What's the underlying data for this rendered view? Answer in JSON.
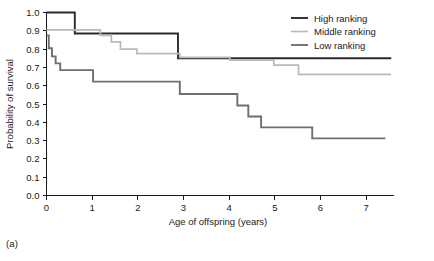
{
  "panel": {
    "label": "(a)"
  },
  "chart_data": {
    "type": "line",
    "title": "",
    "xlabel": "Age of offspring (years)",
    "ylabel": "Probability of survival",
    "xlim": [
      0,
      7.6
    ],
    "ylim": [
      0,
      1.0
    ],
    "xticks": [
      0,
      1,
      2,
      3,
      4,
      5,
      6,
      7
    ],
    "xticklabels": [
      "0",
      "1",
      "2",
      "3",
      "4",
      "5",
      "6",
      "7"
    ],
    "yticks": [
      0.0,
      0.1,
      0.2,
      0.3,
      0.4,
      0.5,
      0.6,
      0.7,
      0.8,
      0.9,
      1.0
    ],
    "yticklabels": [
      "0.0",
      "0.1",
      "0.2",
      "0.3",
      "0.4",
      "0.5",
      "0.6",
      "0.7",
      "0.8",
      "0.9",
      "1.0"
    ],
    "grid": false,
    "legend_position": "top-right",
    "step_style": "post",
    "series": [
      {
        "name": "High ranking",
        "color": "#2b2b2b",
        "width": 1.9,
        "points": [
          [
            0.0,
            1.0
          ],
          [
            0.62,
            1.0
          ],
          [
            0.62,
            0.885
          ],
          [
            2.88,
            0.885
          ],
          [
            2.88,
            0.75
          ],
          [
            7.55,
            0.75
          ]
        ]
      },
      {
        "name": "Middle ranking",
        "color": "#b9b9b9",
        "width": 1.7,
        "points": [
          [
            0.0,
            0.905
          ],
          [
            1.18,
            0.905
          ],
          [
            1.18,
            0.875
          ],
          [
            1.42,
            0.875
          ],
          [
            1.42,
            0.84
          ],
          [
            1.62,
            0.84
          ],
          [
            1.62,
            0.8
          ],
          [
            1.98,
            0.8
          ],
          [
            1.98,
            0.775
          ],
          [
            2.92,
            0.775
          ],
          [
            2.92,
            0.755
          ],
          [
            4.02,
            0.755
          ],
          [
            4.02,
            0.74
          ],
          [
            4.98,
            0.74
          ],
          [
            4.98,
            0.712
          ],
          [
            5.52,
            0.712
          ],
          [
            5.52,
            0.662
          ],
          [
            7.55,
            0.662
          ]
        ]
      },
      {
        "name": "Low ranking",
        "color": "#6f6f6f",
        "width": 1.9,
        "points": [
          [
            0.0,
            0.875
          ],
          [
            0.05,
            0.875
          ],
          [
            0.05,
            0.805
          ],
          [
            0.12,
            0.805
          ],
          [
            0.12,
            0.76
          ],
          [
            0.2,
            0.76
          ],
          [
            0.2,
            0.722
          ],
          [
            0.3,
            0.722
          ],
          [
            0.3,
            0.685
          ],
          [
            1.02,
            0.685
          ],
          [
            1.02,
            0.622
          ],
          [
            2.92,
            0.622
          ],
          [
            2.92,
            0.555
          ],
          [
            4.18,
            0.555
          ],
          [
            4.18,
            0.492
          ],
          [
            4.42,
            0.492
          ],
          [
            4.42,
            0.432
          ],
          [
            4.7,
            0.432
          ],
          [
            4.7,
            0.372
          ],
          [
            5.82,
            0.372
          ],
          [
            5.82,
            0.312
          ],
          [
            7.42,
            0.312
          ]
        ]
      }
    ],
    "legend": [
      {
        "label": "High ranking",
        "color": "#2b2b2b"
      },
      {
        "label": "Middle ranking",
        "color": "#b9b9b9"
      },
      {
        "label": "Low ranking",
        "color": "#6f6f6f"
      }
    ]
  }
}
